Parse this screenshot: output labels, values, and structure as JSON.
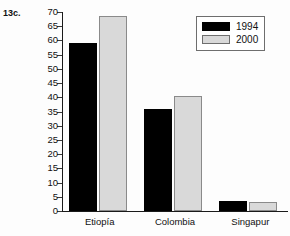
{
  "figure": {
    "label": "13c."
  },
  "chart_data": {
    "type": "bar",
    "title": "",
    "xlabel": "",
    "ylabel": "",
    "categories": [
      "Etiopía",
      "Colombia",
      "Singapur"
    ],
    "series": [
      {
        "name": "1994",
        "color": "#000000",
        "values": [
          59,
          36,
          3.5
        ]
      },
      {
        "name": "2000",
        "color": "#d9d9d9",
        "values": [
          68.5,
          40.5,
          3
        ]
      }
    ],
    "ylim": [
      0,
      70
    ],
    "ytick_step": 5,
    "yticks": [
      0,
      5,
      10,
      15,
      20,
      25,
      30,
      35,
      40,
      45,
      50,
      55,
      60,
      65,
      70
    ],
    "ytick_labels": [
      "0",
      "5",
      "10",
      "15",
      "20",
      "25",
      "30",
      "35",
      "40",
      "45",
      "50",
      "55",
      "60",
      "65",
      "70"
    ],
    "grid": false,
    "legend_position": "top-right",
    "legend_entries": [
      "1994",
      "2000"
    ]
  }
}
